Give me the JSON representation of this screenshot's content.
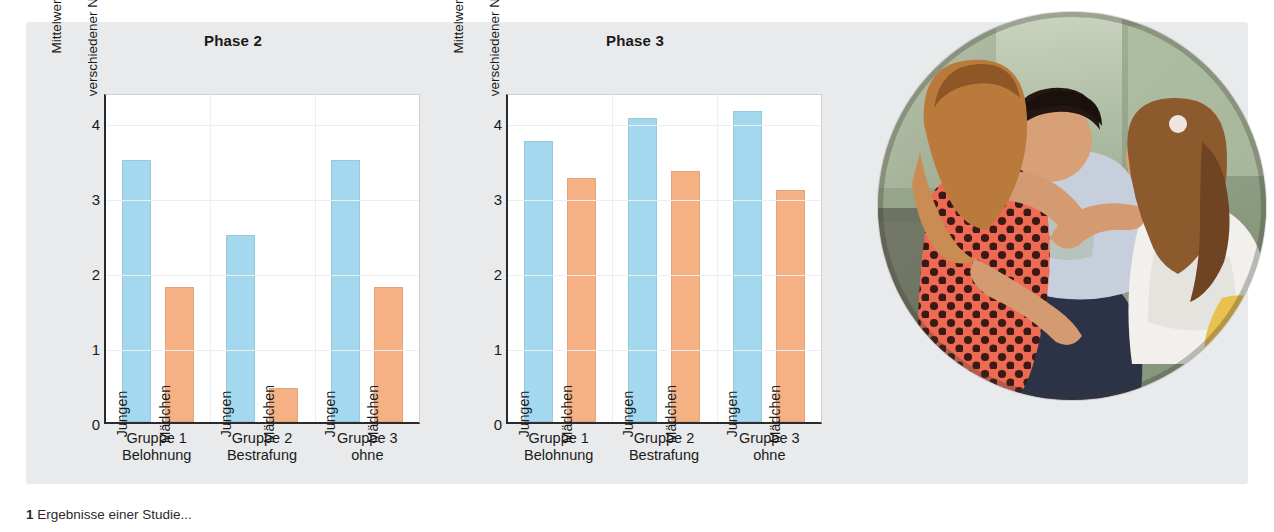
{
  "figure": {
    "caption_number": "1",
    "caption_text": "Ergebnisse einer Studie...",
    "background_color": "#e9eaeb",
    "series_colors": {
      "jungen": "#a4d8ef",
      "maedchen": "#f5b183"
    }
  },
  "photo": {
    "alt": "Drei Kinder in einer koerperlichen Auseinandersetzung",
    "shape": "circle"
  },
  "chart_data": [
    {
      "type": "bar",
      "title": "Phase 2",
      "xlabel": "",
      "ylabel": "Mittelwert der Ausführung verschiedener Nachahmungsreaktionen",
      "ylabel_line1": "Mittelwert der Ausführung",
      "ylabel_line2": "verschiedener Nachahmungsreaktionen",
      "ylim": [
        0,
        4.4
      ],
      "yticks": [
        0,
        1,
        2,
        3,
        4
      ],
      "ytick_labels": [
        "0",
        "1",
        "2",
        "3",
        "4"
      ],
      "grid": true,
      "legend": "none",
      "categories": [
        "Gruppe 1 Belohnung",
        "Gruppe 2 Bestrafung",
        "Gruppe 3 ohne"
      ],
      "category_lines": [
        {
          "line1": "Gruppe 1",
          "line2": "Belohnung"
        },
        {
          "line1": "Gruppe 2",
          "line2": "Bestrafung"
        },
        {
          "line1": "Gruppe 3",
          "line2": "ohne"
        }
      ],
      "series": [
        {
          "name": "Jungen",
          "values": [
            3.5,
            2.5,
            3.5
          ]
        },
        {
          "name": "Mädchen",
          "values": [
            1.8,
            0.45,
            1.8
          ]
        }
      ]
    },
    {
      "type": "bar",
      "title": "Phase 3",
      "xlabel": "",
      "ylabel": "Mittelwert der Ausführung verschiedener Nachahmungsreaktionen",
      "ylabel_line1": "Mittelwert der Ausführung",
      "ylabel_line2": "verschiedener Nachahmungsreaktionen",
      "ylim": [
        0,
        4.4
      ],
      "yticks": [
        0,
        1,
        2,
        3,
        4
      ],
      "ytick_labels": [
        "0",
        "1",
        "2",
        "3",
        "4"
      ],
      "grid": true,
      "legend": "none",
      "categories": [
        "Gruppe 1 Belohnung",
        "Gruppe 2 Bestrafung",
        "Gruppe 3 ohne"
      ],
      "category_lines": [
        {
          "line1": "Gruppe 1",
          "line2": "Belohnung"
        },
        {
          "line1": "Gruppe 2",
          "line2": "Bestrafung"
        },
        {
          "line1": "Gruppe 3",
          "line2": "ohne"
        }
      ],
      "series": [
        {
          "name": "Jungen",
          "values": [
            3.75,
            4.05,
            4.15
          ]
        },
        {
          "name": "Mädchen",
          "values": [
            3.25,
            3.35,
            3.1
          ]
        }
      ]
    }
  ]
}
